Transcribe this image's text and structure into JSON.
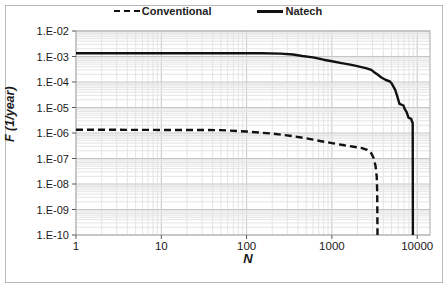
{
  "chart_data": {
    "type": "line",
    "title": "",
    "xlabel": "N",
    "ylabel": "F (1/year)",
    "x_scale": "log",
    "y_scale": "log",
    "xlim": [
      1,
      14000
    ],
    "ylim": [
      1e-10,
      0.01
    ],
    "x_ticks": [
      1,
      10,
      100,
      1000,
      10000
    ],
    "x_tick_labels": [
      "1",
      "10",
      "100",
      "1000",
      "10000"
    ],
    "y_tick_labels": [
      "1.E-02",
      "1.E-03",
      "1.E-04",
      "1.E-05",
      "1.E-06",
      "1.E-07",
      "1.E-08",
      "1.E-09",
      "1.E-10"
    ],
    "grid": "major+minor",
    "legend_position": "top-center",
    "series": [
      {
        "name": "Conventional",
        "style": "dashed",
        "color": "#111111",
        "points": [
          [
            1,
            1.35e-06
          ],
          [
            50,
            1.3e-06
          ],
          [
            100,
            1.15e-06
          ],
          [
            200,
            9.5e-07
          ],
          [
            350,
            7.5e-07
          ],
          [
            500,
            6.2e-07
          ],
          [
            700,
            5e-07
          ],
          [
            1000,
            4e-07
          ],
          [
            1400,
            3.3e-07
          ],
          [
            1800,
            2.9e-07
          ],
          [
            2200,
            2.6e-07
          ],
          [
            2600,
            2.2e-07
          ],
          [
            2900,
            1.6e-07
          ],
          [
            3100,
            1e-07
          ],
          [
            3250,
            5e-08
          ],
          [
            3350,
            2e-08
          ],
          [
            3400,
            5e-09
          ],
          [
            3420,
            1e-10
          ]
        ]
      },
      {
        "name": "Natech",
        "style": "solid",
        "color": "#111111",
        "points": [
          [
            1,
            0.00135
          ],
          [
            150,
            0.00135
          ],
          [
            250,
            0.0013
          ],
          [
            350,
            0.0012
          ],
          [
            450,
            0.00105
          ],
          [
            600,
            0.00092
          ],
          [
            800,
            0.00075
          ],
          [
            1000,
            0.00065
          ],
          [
            1300,
            0.00055
          ],
          [
            1700,
            0.00047
          ],
          [
            2100,
            0.0004
          ],
          [
            2500,
            0.00035
          ],
          [
            2900,
            0.0003
          ],
          [
            3100,
            0.00025
          ],
          [
            3400,
            0.0002
          ],
          [
            3800,
            0.00015
          ],
          [
            4300,
            0.00012
          ],
          [
            4800,
            0.000105
          ],
          [
            5000,
            9e-05
          ],
          [
            5200,
            7e-05
          ],
          [
            5500,
            5e-05
          ],
          [
            5800,
            3e-05
          ],
          [
            6000,
            2e-05
          ],
          [
            6200,
            1.4e-05
          ],
          [
            6900,
            1.2e-05
          ],
          [
            7100,
            9e-06
          ],
          [
            7500,
            6.8e-06
          ],
          [
            7700,
            5.2e-06
          ],
          [
            7900,
            4e-06
          ],
          [
            8500,
            3.6e-06
          ],
          [
            8700,
            2.8e-06
          ],
          [
            8850,
            2.5e-06
          ],
          [
            8900,
            1e-10
          ]
        ]
      }
    ],
    "colors": {
      "axis_text": "#1a1a1a",
      "major_grid": "#c6c6c6",
      "minor_grid": "#e4e4e4",
      "plot_border": "#ababab",
      "tick": "#595959",
      "line": "#111111"
    }
  }
}
